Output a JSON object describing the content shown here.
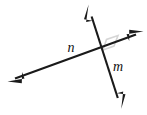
{
  "figure": {
    "type": "geometry-diagram",
    "width": 147,
    "height": 115,
    "background_color": "#ffffff",
    "stroke_color": "#1a1a1a",
    "marker_color": "#dddddd"
  },
  "labels": {
    "line_n": "n",
    "line_m": "m"
  },
  "lines": [
    {
      "name": "n",
      "label": "n",
      "label_x": 71,
      "label_y": 52,
      "x1": 11,
      "y1": 80,
      "x2": 140,
      "y2": 33,
      "arrow_start": true,
      "arrow_end": true
    },
    {
      "name": "m",
      "label": "m",
      "label_x": 118,
      "label_y": 71,
      "x1": 89,
      "y1": 8,
      "x2": 120,
      "y2": 105,
      "arrow_start": true,
      "arrow_end": true
    }
  ],
  "intersection": {
    "x": 103,
    "y": 50
  },
  "right_angle_marker": {
    "present": true,
    "quadrant": "upper-right",
    "size": 12
  }
}
